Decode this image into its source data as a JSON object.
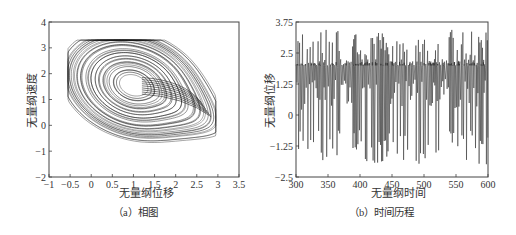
{
  "chart_data": [
    {
      "id": "a",
      "type": "line",
      "subtype": "phase-portrait",
      "caption": "（a）相图",
      "xlabel": "无量纲位移",
      "ylabel": "无量纲速度",
      "xlim": [
        -1,
        3.5
      ],
      "ylim": [
        -2,
        4
      ],
      "xticks": [
        -1,
        -0.5,
        0,
        0.5,
        1,
        1.5,
        2,
        2.5,
        3,
        3.5
      ],
      "xtick_labels": [
        "−1",
        "−0.5",
        "0",
        "0.5",
        "1",
        "1.5",
        "2",
        "2.5",
        "3",
        "3.5"
      ],
      "yticks": [
        -2,
        -1,
        0,
        1,
        2,
        3,
        4
      ],
      "ytick_labels": [
        "−2",
        "−1",
        "0",
        "1",
        "2",
        "3",
        "4"
      ],
      "grid": false,
      "line_color": "#111111",
      "description": "Chaotic attractor: nested spiral orbits centered near (1.0, 1.5), outer envelope spanning x≈-0.5..2.95, y≈-1.1..3.3, with a folded tail reaching toward (2.9, 0.2)",
      "center": [
        1.0,
        1.5
      ],
      "outer_extent": {
        "x": [
          -0.5,
          2.95
        ],
        "y": [
          -1.15,
          3.3
        ]
      },
      "inner_extent": {
        "x": [
          0.7,
          1.4
        ],
        "y": [
          1.2,
          1.85
        ]
      }
    },
    {
      "id": "b",
      "type": "line",
      "subtype": "time-history",
      "caption": "（b）时间历程",
      "xlabel": "无量纲时间",
      "ylabel": "无量纲位移",
      "xlim": [
        300,
        600
      ],
      "ylim": [
        -2.5,
        3.75
      ],
      "xticks": [
        300,
        350,
        400,
        450,
        500,
        550,
        600
      ],
      "xtick_labels": [
        "300",
        "350",
        "400",
        "450",
        "500",
        "550",
        "600"
      ],
      "yticks": [
        -2.5,
        -1.25,
        0,
        1.25,
        2.5,
        3.75
      ],
      "ytick_labels": [
        "−2.5",
        "−1.25",
        "0",
        "1.25",
        "2.5",
        "3.75"
      ],
      "grid": false,
      "line_color": "#222222",
      "description": "Chaotic oscillation; peaks up to ≈3.4, troughs down to ≈-2.0, dense band around 2.0 and 0.5–2.0",
      "value_range": [
        -2.05,
        3.45
      ]
    }
  ]
}
